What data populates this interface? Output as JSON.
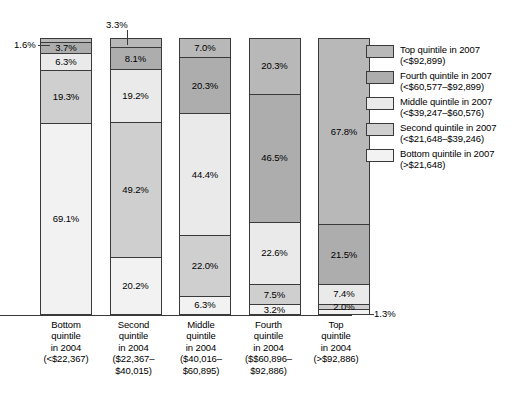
{
  "chart_data": {
    "type": "bar",
    "subtype": "stacked-bar-100",
    "title": "",
    "xlabel": "",
    "ylabel": "",
    "ylim": [
      0,
      100
    ],
    "grid": false,
    "legend_position": "right",
    "categories": [
      "Bottom quintile in 2004 (<$22,367)",
      "Second quintile in 2004 ($22,367–$40,015)",
      "Middle quintile in 2004 ($40,016–$60,895)",
      "Fourth quintile in 2004 ($$60,896–$92,886)",
      "Top quintile in 2004 (>$92,886)"
    ],
    "series": [
      {
        "name": "Top quintile in 2007 (<$92,899)",
        "values": [
          1.6,
          3.3,
          7.0,
          20.3,
          67.8
        ]
      },
      {
        "name": "Fourth quintile in 2007 (<$60,577–$92,899)",
        "values": [
          3.7,
          8.1,
          20.3,
          46.5,
          21.5
        ]
      },
      {
        "name": "Middle quintile in 2007 (<$39,247–$60,576)",
        "values": [
          6.3,
          19.2,
          44.4,
          22.6,
          7.4
        ]
      },
      {
        "name": "Second quintile in 2007 (<$21,648–$39,246)",
        "values": [
          19.3,
          49.2,
          22.0,
          7.5,
          2.0
        ]
      },
      {
        "name": "Bottom quintile in 2007 (>$21,648)",
        "values": [
          69.1,
          20.2,
          6.3,
          3.2,
          1.3
        ]
      }
    ]
  },
  "colors": {
    "top_quintile": "#b8b8b8",
    "fourth_quintile": "#adadad",
    "middle_quintile": "#eaeaea",
    "second_quintile": "#cfcfcf",
    "bottom_quintile": "#f2f2f2",
    "outline": "#3a3a3a",
    "background": "#ffffff"
  },
  "bars": [
    {
      "id": "bar-bottom-2004",
      "total_percent": 100,
      "segments": [
        {
          "key": "top",
          "label": "1.6%",
          "value": 1.6,
          "label_inside": false
        },
        {
          "key": "fourth",
          "label": "3.7%",
          "value": 3.7,
          "label_inside": true
        },
        {
          "key": "middle",
          "label": "6.3%",
          "value": 6.3,
          "label_inside": true
        },
        {
          "key": "second",
          "label": "19.3%",
          "value": 19.3,
          "label_inside": true
        },
        {
          "key": "bottom",
          "label": "69.1%",
          "value": 69.1,
          "label_inside": true
        }
      ]
    },
    {
      "id": "bar-second-2004",
      "total_percent": 100,
      "segments": [
        {
          "key": "top",
          "label": "3.3%",
          "value": 3.3,
          "label_inside": false
        },
        {
          "key": "fourth",
          "label": "8.1%",
          "value": 8.1,
          "label_inside": true
        },
        {
          "key": "middle",
          "label": "19.2%",
          "value": 19.2,
          "label_inside": true
        },
        {
          "key": "second",
          "label": "49.2%",
          "value": 49.2,
          "label_inside": true
        },
        {
          "key": "bottom",
          "label": "20.2%",
          "value": 20.2,
          "label_inside": true
        }
      ]
    },
    {
      "id": "bar-middle-2004",
      "total_percent": 100,
      "segments": [
        {
          "key": "top",
          "label": "7.0%",
          "value": 7.0,
          "label_inside": true
        },
        {
          "key": "fourth",
          "label": "20.3%",
          "value": 20.3,
          "label_inside": true
        },
        {
          "key": "middle",
          "label": "44.4%",
          "value": 44.4,
          "label_inside": true
        },
        {
          "key": "second",
          "label": "22.0%",
          "value": 22.0,
          "label_inside": true
        },
        {
          "key": "bottom",
          "label": "6.3%",
          "value": 6.3,
          "label_inside": true
        }
      ]
    },
    {
      "id": "bar-fourth-2004",
      "total_percent": 100,
      "segments": [
        {
          "key": "top",
          "label": "20.3%",
          "value": 20.3,
          "label_inside": true
        },
        {
          "key": "fourth",
          "label": "46.5%",
          "value": 46.5,
          "label_inside": true
        },
        {
          "key": "middle",
          "label": "22.6%",
          "value": 22.6,
          "label_inside": true
        },
        {
          "key": "second",
          "label": "7.5%",
          "value": 7.5,
          "label_inside": true
        },
        {
          "key": "bottom",
          "label": "3.2%",
          "value": 3.2,
          "label_inside": true
        }
      ]
    },
    {
      "id": "bar-top-2004",
      "total_percent": 100,
      "segments": [
        {
          "key": "top",
          "label": "67.8%",
          "value": 67.8,
          "label_inside": true
        },
        {
          "key": "fourth",
          "label": "21.5%",
          "value": 21.5,
          "label_inside": true
        },
        {
          "key": "middle",
          "label": "7.4%",
          "value": 7.4,
          "label_inside": true
        },
        {
          "key": "second",
          "label": "2.0%",
          "value": 2.0,
          "label_inside": true
        },
        {
          "key": "bottom",
          "label": "1.3%",
          "value": 1.3,
          "label_inside": false
        }
      ]
    }
  ],
  "callouts": [
    {
      "id": "callout-bar1-top",
      "label": "1.6%"
    },
    {
      "id": "callout-bar2-top",
      "label": "3.3%"
    },
    {
      "id": "callout-bar5-bottom",
      "label": "1.3%"
    }
  ],
  "x_axis": {
    "labels": [
      {
        "line1": "Bottom",
        "line2": "quintile",
        "line3": "in 2004",
        "line4": "(<$22,367)"
      },
      {
        "line1": "Second",
        "line2": "quintile",
        "line3": "in 2004",
        "line4": "($22,367–",
        "line5": "$40,015)"
      },
      {
        "line1": "Middle",
        "line2": "quintile",
        "line3": "in 2004",
        "line4": "($40,016–",
        "line5": "$60,895)"
      },
      {
        "line1": "Fourth",
        "line2": "quintile",
        "line3": "in 2004",
        "line4": "($$60,896–",
        "line5": "$92,886)"
      },
      {
        "line1": "Top",
        "line2": "quintile",
        "line3": "in 2004",
        "line4": "(>$92,886)"
      }
    ]
  },
  "legend": {
    "items": [
      {
        "key": "top",
        "line1": "Top quintile in 2007",
        "line2": "(<$92,899)"
      },
      {
        "key": "fourth",
        "line1": "Fourth quintile in 2007",
        "line2": "(<$60,577–$92,899)"
      },
      {
        "key": "middle",
        "line1": "Middle quintile in 2007",
        "line2": "(<$39,247–$60,576)"
      },
      {
        "key": "second",
        "line1": "Second quintile in 2007",
        "line2": "(<$21,648–$39,246)"
      },
      {
        "key": "bottom",
        "line1": "Bottom quintile in 2007",
        "line2": "(>$21,648)"
      }
    ]
  }
}
